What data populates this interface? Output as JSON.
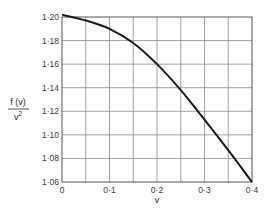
{
  "chart_data": {
    "type": "line",
    "title": "",
    "xlabel": "v",
    "ylabel_numerator": "f (v)",
    "ylabel_denominator": "v 2",
    "xlim": [
      0,
      0.4
    ],
    "ylim": [
      1.06,
      1.2
    ],
    "grid": true,
    "x_ticks": [
      {
        "value": 0,
        "label": "0"
      },
      {
        "value": 0.1,
        "label": "0·1"
      },
      {
        "value": 0.2,
        "label": "0·2"
      },
      {
        "value": 0.3,
        "label": "0·3"
      },
      {
        "value": 0.4,
        "label": "0·4"
      }
    ],
    "y_ticks": [
      {
        "value": 1.2,
        "label": "1·20"
      },
      {
        "value": 1.18,
        "label": "1·18"
      },
      {
        "value": 1.16,
        "label": "1·16"
      },
      {
        "value": 1.14,
        "label": "1·14"
      },
      {
        "value": 1.12,
        "label": "1·12"
      },
      {
        "value": 1.1,
        "label": "1·10"
      },
      {
        "value": 1.08,
        "label": "1·08"
      },
      {
        "value": 1.06,
        "label": "1·06"
      }
    ],
    "x_grid_step": 0.05,
    "y_grid_step": 0.02,
    "series": [
      {
        "name": "f(v)/v^2",
        "x": [
          0,
          0.05,
          0.1,
          0.15,
          0.2,
          0.25,
          0.3,
          0.35,
          0.4
        ],
        "y": [
          1.202,
          1.197,
          1.19,
          1.178,
          1.16,
          1.138,
          1.113,
          1.087,
          1.06
        ]
      }
    ]
  }
}
